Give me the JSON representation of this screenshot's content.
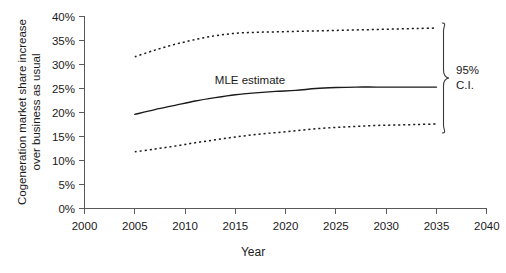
{
  "chart_data": {
    "type": "line",
    "title": "",
    "xlabel": "Year",
    "ylabel": "Cogeneration market share increase over business as usual",
    "ylabel_line1": "Cogeneration market share increase",
    "ylabel_line2": "over business as usual",
    "xlim": [
      2000,
      2040
    ],
    "ylim": [
      0,
      40
    ],
    "grid": false,
    "legend_position": "inline-annotation",
    "x_tick_labels": [
      "2000",
      "2005",
      "2010",
      "2015",
      "2020",
      "2025",
      "2030",
      "2035",
      "2040"
    ],
    "x_ticks": [
      2000,
      2005,
      2010,
      2015,
      2020,
      2025,
      2030,
      2035,
      2040
    ],
    "y_tick_labels": [
      "0%",
      "5%",
      "10%",
      "15%",
      "20%",
      "25%",
      "30%",
      "35%",
      "40%"
    ],
    "y_ticks": [
      0,
      5,
      10,
      15,
      20,
      25,
      30,
      35,
      40
    ],
    "x": [
      2005,
      2007,
      2009,
      2011,
      2013,
      2015,
      2017,
      2019,
      2021,
      2023,
      2025,
      2027,
      2029,
      2031,
      2033,
      2035
    ],
    "series": [
      {
        "name": "95% C.I. upper bound",
        "style": "dotted",
        "values": [
          31.6,
          33.0,
          34.2,
          35.2,
          36.0,
          36.5,
          36.7,
          36.8,
          36.9,
          37.0,
          37.1,
          37.2,
          37.3,
          37.4,
          37.5,
          37.6
        ]
      },
      {
        "name": "MLE estimate",
        "style": "solid",
        "values": [
          19.6,
          20.6,
          21.5,
          22.4,
          23.1,
          23.7,
          24.1,
          24.4,
          24.6,
          25.0,
          25.2,
          25.3,
          25.3,
          25.3,
          25.3,
          25.3
        ]
      },
      {
        "name": "95% C.I. lower bound",
        "style": "dotted",
        "values": [
          11.8,
          12.4,
          13.0,
          13.7,
          14.3,
          14.9,
          15.4,
          15.8,
          16.2,
          16.6,
          16.9,
          17.1,
          17.3,
          17.4,
          17.5,
          17.6
        ]
      }
    ],
    "annotations": [
      {
        "name": "mle-estimate-label",
        "text": "MLE estimate",
        "x": 2017,
        "y": 27.5
      },
      {
        "name": "ci-label-line1",
        "text": "95%",
        "x": 2039,
        "y": 22.5
      },
      {
        "name": "ci-label-line2",
        "text": "C.I.",
        "x": 2039,
        "y": 19.8
      }
    ],
    "brace": {
      "name": "confidence-interval-brace",
      "label": "95% C.I.",
      "spans_series": [
        "95% C.I. upper bound",
        "95% C.I. lower bound"
      ]
    },
    "colors": {
      "line": "#1a1a1a",
      "axis": "#5a5a5a",
      "background": "#ffffff"
    }
  }
}
